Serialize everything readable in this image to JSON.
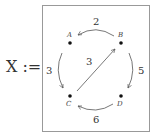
{
  "lhs": {
    "symbol": "X :="
  },
  "nodes": [
    {
      "id": "A",
      "label": "A",
      "x": 70,
      "y": 43
    },
    {
      "id": "B",
      "label": "B",
      "x": 121,
      "y": 43
    },
    {
      "id": "C",
      "label": "C",
      "x": 70,
      "y": 96
    },
    {
      "id": "D",
      "label": "D",
      "x": 121,
      "y": 96
    }
  ],
  "edges": [
    {
      "from": "B",
      "to": "A",
      "weight": "2"
    },
    {
      "from": "A",
      "to": "C",
      "weight": "3"
    },
    {
      "from": "B",
      "to": "D",
      "weight": "5"
    },
    {
      "from": "D",
      "to": "C",
      "weight": "6"
    },
    {
      "from": "C",
      "to": "B",
      "weight": "3"
    }
  ],
  "colors": {
    "stroke": "#555555",
    "frame": "#999999",
    "text": "#333333"
  }
}
